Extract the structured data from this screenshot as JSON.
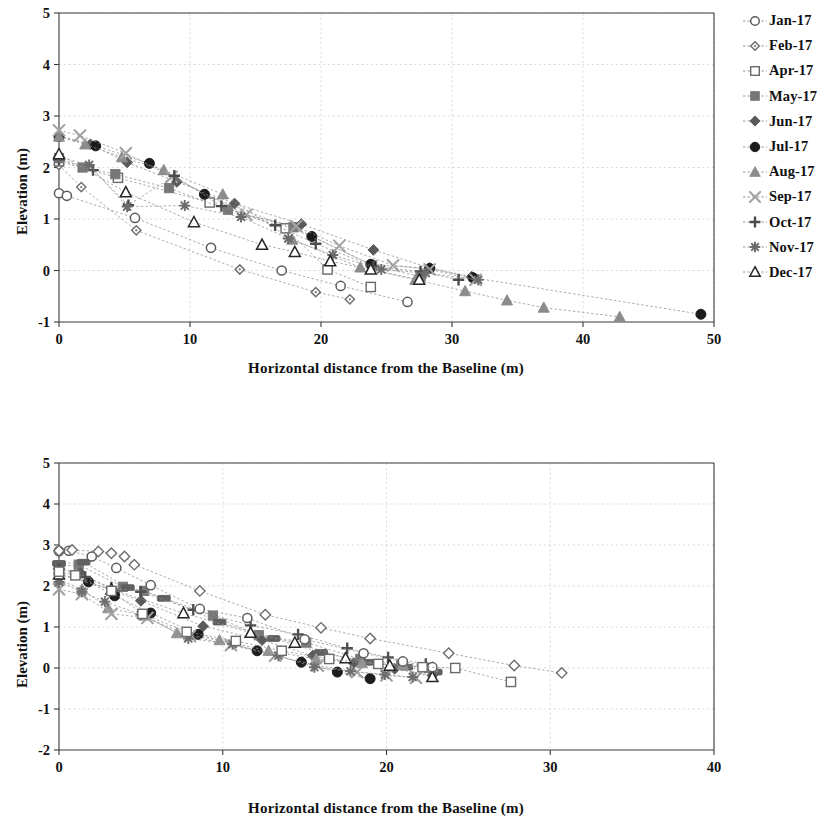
{
  "figure": {
    "panels": [
      "chart1",
      "chart2"
    ]
  },
  "chart_data": [
    {
      "id": "chart1",
      "type": "line",
      "title": "",
      "xlabel": "Horizontal distance from the Baseline (m)",
      "ylabel": "Elevation (m)",
      "xlim": [
        0,
        50
      ],
      "ylim": [
        -1,
        5
      ],
      "xticks": [
        0,
        10,
        20,
        30,
        40,
        50
      ],
      "yticks": [
        -1,
        0,
        1,
        2,
        3,
        4,
        5
      ],
      "grid": true,
      "legend_position": "right",
      "series": [
        {
          "name": "Jan-17",
          "marker": "circle-open",
          "color": "#5c5c5c",
          "x": [
            0.0,
            0.6,
            5.8,
            11.6,
            17.0,
            21.5,
            26.6
          ],
          "y": [
            1.5,
            1.45,
            1.02,
            0.44,
            0.0,
            -0.3,
            -0.61
          ]
        },
        {
          "name": "Feb-17",
          "marker": "diamond-small",
          "color": "#707070",
          "x": [
            0.0,
            1.7,
            5.9,
            13.8,
            19.6,
            22.2
          ],
          "y": [
            2.05,
            1.62,
            0.78,
            0.02,
            -0.42,
            -0.56
          ]
        },
        {
          "name": "Apr-17",
          "marker": "square-open",
          "color": "#6a6a6a",
          "x": [
            0.0,
            4.5,
            11.5,
            17.3,
            20.5,
            23.8
          ],
          "y": [
            2.12,
            1.8,
            1.32,
            0.82,
            0.02,
            -0.32
          ]
        },
        {
          "name": "May-17",
          "marker": "square-filled",
          "color": "#777777",
          "x": [
            0.0,
            1.8,
            4.3,
            8.4,
            12.9,
            17.9,
            23.9,
            27.6
          ],
          "y": [
            2.18,
            2.0,
            1.87,
            1.6,
            1.18,
            0.84,
            0.1,
            -0.12
          ]
        },
        {
          "name": "Jun-17",
          "marker": "diamond-filled",
          "color": "#5a5a5a",
          "x": [
            0.0,
            2.4,
            5.2,
            9.0,
            13.4,
            18.5,
            24.0,
            28.3,
            31.5
          ],
          "y": [
            2.62,
            2.45,
            2.1,
            1.72,
            1.3,
            0.9,
            0.4,
            0.05,
            -0.12
          ]
        },
        {
          "name": "Jul-17",
          "marker": "circle-filled",
          "color": "#1b1b1b",
          "x": [
            0.0,
            2.8,
            6.9,
            11.1,
            19.3,
            23.8,
            28.3,
            31.6,
            49.0
          ],
          "y": [
            2.6,
            2.42,
            2.08,
            1.48,
            0.66,
            0.12,
            0.04,
            -0.14,
            -0.85
          ]
        },
        {
          "name": "Aug-17",
          "marker": "triangle-filled",
          "color": "#8c8c8c",
          "x": [
            0.0,
            2.0,
            4.8,
            8.0,
            12.5,
            17.8,
            23.0,
            27.2,
            31.0,
            34.2,
            37.0,
            42.8
          ],
          "y": [
            2.6,
            2.45,
            2.2,
            1.95,
            1.48,
            0.6,
            0.06,
            -0.18,
            -0.4,
            -0.58,
            -0.72,
            -0.9
          ]
        },
        {
          "name": "Sep-17",
          "marker": "x-cross",
          "color": "#a3a3a3",
          "x": [
            0.0,
            1.6,
            5.1,
            8.6,
            14.3,
            18.1,
            21.4,
            25.5,
            28.3,
            31.8
          ],
          "y": [
            2.72,
            2.62,
            2.28,
            1.82,
            1.08,
            0.86,
            0.48,
            0.1,
            0.02,
            -0.18
          ]
        },
        {
          "name": "Oct-17",
          "marker": "plus",
          "color": "#4c4c4c",
          "x": [
            0.0,
            2.6,
            5.3,
            8.8,
            12.4,
            16.5,
            19.6,
            24.0,
            27.6,
            30.5
          ],
          "y": [
            2.15,
            1.95,
            1.27,
            1.84,
            1.25,
            0.88,
            0.52,
            0.08,
            -0.02,
            -0.18
          ]
        },
        {
          "name": "Nov-17",
          "marker": "star",
          "color": "#6b6b6b",
          "x": [
            0.0,
            2.3,
            5.2,
            9.6,
            13.9,
            17.5,
            20.9,
            24.6,
            28.0,
            32.0
          ],
          "y": [
            2.2,
            2.05,
            1.24,
            1.26,
            1.04,
            0.62,
            0.3,
            0.02,
            -0.05,
            -0.18
          ]
        },
        {
          "name": "Dec-17",
          "marker": "triangle-open",
          "color": "#262626",
          "x": [
            0.0,
            5.1,
            10.3,
            15.5,
            18.0,
            20.7,
            23.8,
            27.5
          ],
          "y": [
            2.26,
            1.52,
            0.94,
            0.5,
            0.36,
            0.18,
            0.02,
            -0.18
          ]
        }
      ]
    },
    {
      "id": "chart2",
      "type": "line",
      "title": "",
      "xlabel": "Horizontal distance from the Baseline (m)",
      "ylabel": "Elevation (m)",
      "xlim": [
        0,
        40
      ],
      "ylim": [
        -2,
        5
      ],
      "xticks": [
        0,
        10,
        20,
        30,
        40
      ],
      "yticks": [
        -2,
        -1,
        0,
        1,
        2,
        3,
        4,
        5
      ],
      "grid": true,
      "legend_position": "right",
      "series": [
        {
          "name": "Jan-18",
          "marker": "square-filled",
          "color": "#787878",
          "x": [
            0.0,
            1.2,
            3.9,
            5.2,
            9.4,
            12.2,
            15.1,
            18.4,
            20.9,
            22.6
          ],
          "y": [
            2.48,
            2.52,
            1.98,
            1.88,
            1.28,
            0.8,
            0.62,
            0.22,
            0.08,
            0.0
          ]
        },
        {
          "name": "Feb-18",
          "marker": "diamond-filled",
          "color": "#5a5a5a",
          "x": [
            0.0,
            1.3,
            3.4,
            5.0,
            8.8,
            12.4,
            15.5,
            18.0,
            20.5,
            22.8
          ],
          "y": [
            2.42,
            2.32,
            1.86,
            1.64,
            1.02,
            0.68,
            0.3,
            0.12,
            -0.02,
            -0.18
          ]
        },
        {
          "name": "Mar-18",
          "marker": "dash-bar",
          "color": "#606060",
          "x": [
            0.0,
            1.5,
            4.2,
            6.4,
            9.8,
            13.1,
            16.0,
            18.8,
            21.2,
            23.0
          ],
          "y": [
            2.55,
            2.58,
            1.96,
            1.7,
            1.12,
            0.72,
            0.38,
            0.14,
            0.02,
            -0.1
          ]
        },
        {
          "name": "Apr-18",
          "marker": "circle-filled",
          "color": "#1d1d1d",
          "x": [
            0.0,
            1.8,
            3.4,
            5.6,
            8.5,
            12.1,
            14.8,
            17.0,
            19.0
          ],
          "y": [
            2.3,
            2.1,
            1.76,
            1.34,
            0.82,
            0.42,
            0.14,
            -0.1,
            -0.26
          ]
        },
        {
          "name": "May-18",
          "marker": "triangle-filled",
          "color": "#939393",
          "x": [
            0.0,
            1.4,
            3.0,
            5.2,
            7.2,
            9.8,
            12.8,
            15.7,
            18.5,
            21.0,
            22.8
          ],
          "y": [
            2.15,
            1.92,
            1.46,
            1.28,
            0.85,
            0.68,
            0.42,
            0.22,
            0.12,
            0.08,
            0.02
          ]
        },
        {
          "name": "Jun-18",
          "marker": "x-cross",
          "color": "#a0a0a0",
          "x": [
            0.0,
            1.4,
            3.2,
            5.4,
            8.0,
            10.5,
            13.2,
            15.8,
            18.2,
            20.0,
            21.8
          ],
          "y": [
            1.92,
            1.8,
            1.32,
            1.22,
            0.78,
            0.56,
            0.3,
            0.06,
            -0.1,
            -0.18,
            -0.24
          ]
        },
        {
          "name": "Jul-18",
          "marker": "plus",
          "color": "#4f4f4f",
          "x": [
            0.0,
            1.6,
            3.2,
            5.0,
            8.2,
            11.7,
            14.6,
            17.6,
            20.1,
            22.4
          ],
          "y": [
            2.42,
            2.22,
            1.96,
            1.86,
            1.42,
            1.04,
            0.82,
            0.48,
            0.26,
            0.1
          ]
        },
        {
          "name": "Aug-18",
          "marker": "star",
          "color": "#6e6e6e",
          "x": [
            0.0,
            1.4,
            2.8,
            5.0,
            7.9,
            10.6,
            13.4,
            15.6,
            17.8,
            19.9,
            21.6
          ],
          "y": [
            2.1,
            1.86,
            1.62,
            1.3,
            0.72,
            0.58,
            0.3,
            0.02,
            -0.08,
            -0.16,
            -0.22
          ]
        },
        {
          "name": "Sep-18",
          "marker": "triangle-open",
          "color": "#262626",
          "x": [
            0.0,
            3.2,
            7.6,
            11.7,
            14.4,
            17.5,
            20.2,
            22.8
          ],
          "y": [
            2.28,
            1.92,
            1.34,
            0.86,
            0.62,
            0.24,
            0.06,
            -0.22
          ]
        },
        {
          "name": "Oct-18",
          "marker": "circle-open",
          "color": "#5c5c5c",
          "x": [
            0.0,
            0.6,
            2.0,
            3.5,
            5.6,
            8.6,
            11.5,
            15.0,
            18.6,
            21.0,
            22.8
          ],
          "y": [
            2.85,
            2.86,
            2.72,
            2.44,
            2.02,
            1.44,
            1.22,
            0.7,
            0.36,
            0.16,
            0.02
          ]
        },
        {
          "name": "Nov-18",
          "marker": "diamond-open",
          "color": "#6d6d6d",
          "x": [
            0.0,
            0.8,
            2.4,
            3.2,
            4.0,
            4.6,
            8.6,
            12.6,
            16.0,
            19.0,
            23.8,
            27.8,
            30.7
          ],
          "y": [
            2.86,
            2.88,
            2.84,
            2.8,
            2.72,
            2.52,
            1.88,
            1.3,
            0.98,
            0.72,
            0.36,
            0.06,
            -0.12
          ]
        },
        {
          "name": "Dec-18",
          "marker": "square-open",
          "color": "#6a6a6a",
          "x": [
            0.0,
            1.0,
            3.2,
            5.1,
            7.8,
            10.8,
            13.6,
            16.5,
            19.5,
            22.2,
            24.2,
            27.6
          ],
          "y": [
            2.35,
            2.26,
            1.88,
            1.32,
            0.88,
            0.66,
            0.42,
            0.22,
            0.1,
            0.02,
            0.0,
            -0.34
          ]
        }
      ]
    }
  ]
}
